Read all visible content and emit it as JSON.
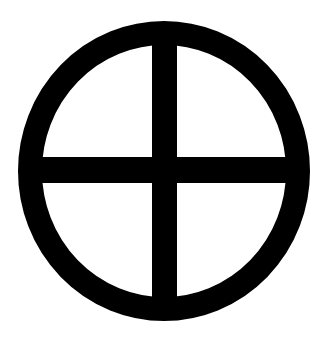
{
  "symbol": {
    "name": "sun-cross",
    "color": "#000000",
    "background": "#ffffff",
    "circle": {
      "cx": 164,
      "cy": 171,
      "r_outer_x": 146,
      "r_outer_y": 150,
      "stroke": 24
    },
    "vertical_bar": {
      "x": 152,
      "width": 25
    },
    "horizontal_bar": {
      "y": 157,
      "height": 26
    }
  }
}
